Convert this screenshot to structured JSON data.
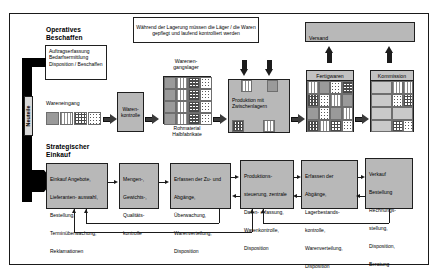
{
  "diagram": {
    "title_note": "Während der Lagerung müssen die Läger / die Waren gepflegt und laufend kontrolliert werden",
    "side_tab": "Neuteile",
    "headings": {
      "operative": "Operatives\nBeschaffen",
      "strategic": "Strategischer\nEinkauf"
    },
    "top_box": "Auftragserfassung\nBedarfsermittlung\nDisposition /\n    Beschaffen",
    "labels": {
      "wareneingang": "Wareneingang",
      "wareneingangslager": "Warenen-\ngangslager",
      "rohmaterial": "Rohmaterial\nHalbfabrikate",
      "warenkontrolle": "Waren-\nkontrolle",
      "produktion": "Produktion mit\nZwischenlagern",
      "fertigwaren": "Fertigwaren",
      "kommission": "Kommission",
      "versand": "Versand"
    },
    "bottom_boxes": [
      "Einkauf\nAngebote, Lieferanten-\nauswahl, Bestellung,\nTerminüberwachung,\nReklamationen",
      "Mengen-,\nGewichts-,\nQualitäts-\nkontrolle",
      "Erfassen der\nZu- und Abgänge,\nÜberwachung,\nWarenverteilung,\nDisposition",
      "Produktions-\nsteuerung,\nzentrale Daten-\nerfassung,\nWarenkontrolle,\nDisposition",
      "Erfassen der\nAbgänge,\nLagerbestands-\nkontrolle,\nWarenverteilung,\nDisposition",
      "Verkauf\nBestellung\nRechnungs-\nstellung,\nDisposition,\nBeratung"
    ],
    "colors": {
      "box_fill": "#b8b8b8",
      "arrow_fill": "#3a3a3a",
      "frame_line": "#1a1a1a",
      "tab_fill": "#d8d8d8"
    }
  }
}
